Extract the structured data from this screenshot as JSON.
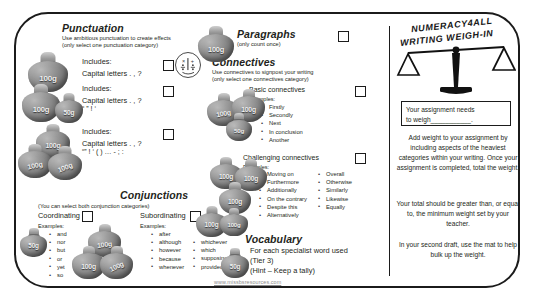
{
  "footer": {
    "url": "www.missbsresources.com"
  },
  "title": {
    "line1": "NUMERACY4ALL",
    "line2": "WRITING WEIGH-IN"
  },
  "punctuation": {
    "heading": "Punctuation",
    "sub1": "Use ambitious punctuation to create effects",
    "sub2": "(only select one punctuation category)",
    "rows": [
      {
        "includes": "Includes:",
        "detail": "Capital letters .  , ?",
        "detail2": "",
        "bags": "100g"
      },
      {
        "includes": "Includes:",
        "detail": "Capital letters .  , ?",
        "detail2": "“ ” ! ‘",
        "bags": "100g 50g"
      },
      {
        "includes": "Includes:",
        "detail": "Capital letters .  , ?",
        "detail2": "“” ! ‘ ( ) … - ; :",
        "bags": "100g 100g 100g"
      }
    ],
    "icon": "math-face-icon"
  },
  "paragraphs": {
    "heading": "Paragraphs",
    "sub": "(only count once)",
    "weight": "100g"
  },
  "connectives": {
    "heading": "Connectives",
    "sub1": "Use connectives to signpost your writing",
    "sub2": "(only select one connectives category)",
    "basic": {
      "label": "Basic connectives",
      "examples_label": "Examples:",
      "items": [
        "Firstly",
        "Secondly",
        "Next",
        "In conclusion",
        "Another"
      ],
      "weights": "100g 100g 50g"
    },
    "challenging": {
      "label": "Challenging connectives",
      "examples_label": "Examples:",
      "col1": [
        "Moving on",
        "Furthermore",
        "Additionally",
        "On the contrary",
        "Despite this",
        "Alternatively"
      ],
      "col2": [
        "Overall",
        "Otherwise",
        "Similarly",
        "Likewise",
        "Equally"
      ],
      "weights": "100g 100g 100g"
    }
  },
  "conjunctions": {
    "heading": "Conjunctions",
    "sub": "(You can select both conjunction categories)",
    "coordinating": {
      "label": "Coordinating",
      "examples_label": "Examples:",
      "items": [
        "and",
        "nor",
        "but",
        "or",
        "yet",
        "so"
      ],
      "weight": "50g"
    },
    "subordinating": {
      "label": "Subordinating",
      "examples_label": "Examples:",
      "col1": [
        "after",
        "although",
        "however",
        "because",
        "whenever"
      ],
      "col2": [
        "whichever",
        "which",
        "supposing",
        "provided"
      ],
      "weights": "100g 100g 100g"
    }
  },
  "vocabulary": {
    "heading": "Vocabulary",
    "line1": "For each specialist word used",
    "line2": "(Tier 3)",
    "line3": "(Hint – Keep a tally)",
    "weight": "50g"
  },
  "notes": {
    "assignment_line1": "Your assignment needs",
    "assignment_line2": "to weigh___________.",
    "para1": "Add weight to your assignment by including aspects of the heaviest categories within your writing. Once your assignment is completed, total the weight.",
    "para2": "Your total should be greater than, or equal to, the minimum weight set by your teacher.",
    "para3": "In your second draft, use the mat to help bulk up the weight."
  },
  "colors": {
    "ink": "#231f20",
    "bag": "#8e8e8e",
    "muted": "#8d8d8d"
  }
}
